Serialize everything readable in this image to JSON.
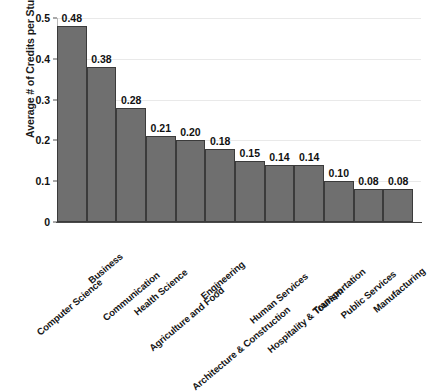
{
  "chart_data": {
    "type": "bar",
    "title": "",
    "xlabel": "",
    "ylabel": "Average # of Credits per Student",
    "ylim": [
      0,
      0.5
    ],
    "yticks": [
      "0",
      "0.1",
      "0.2",
      "0.3",
      "0.4",
      "0.5"
    ],
    "ytick_values": [
      0,
      0.1,
      0.2,
      0.3,
      0.4,
      0.5
    ],
    "grid": true,
    "legend": "none",
    "bar_color": "#6f6f6f",
    "bar_edge_color": "#3b3b3b",
    "gridline_color": "#e9e9e9",
    "axis_color": "#4a4a4a",
    "categories": [
      "Computer Science",
      "Business",
      "Communication",
      "Health Science",
      "Agriculture and Food",
      "Engineering",
      "Architecture & Construction",
      "Human Services",
      "Hospitality & Tourism",
      "Transportation",
      "Public Services",
      "Manufacturing"
    ],
    "values": [
      0.48,
      0.38,
      0.28,
      0.21,
      0.2,
      0.18,
      0.15,
      0.14,
      0.14,
      0.1,
      0.08,
      0.08
    ],
    "data_labels": [
      "0.48",
      "0.38",
      "0.28",
      "0.21",
      "0.20",
      "0.18",
      "0.15",
      "0.14",
      "0.14",
      "0.10",
      "0.08",
      "0.08"
    ]
  }
}
